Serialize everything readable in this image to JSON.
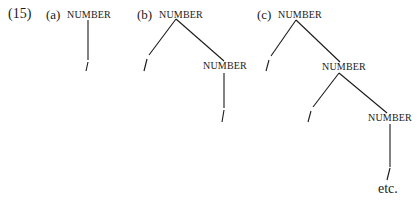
{
  "example": {
    "number": "(15)",
    "trees": [
      {
        "label": "(a)",
        "root": "NUMBER",
        "leaf": "/"
      },
      {
        "label": "(b)",
        "root": "NUMBER",
        "left_leaf": "/",
        "child": "NUMBER",
        "child_leaf": "/"
      },
      {
        "label": "(c)",
        "root": "NUMBER",
        "left_leaf": "/",
        "child": "NUMBER",
        "child_left_leaf": "/",
        "grandchild": "NUMBER",
        "grandchild_leaf": "/",
        "continuation": "etc."
      }
    ]
  }
}
